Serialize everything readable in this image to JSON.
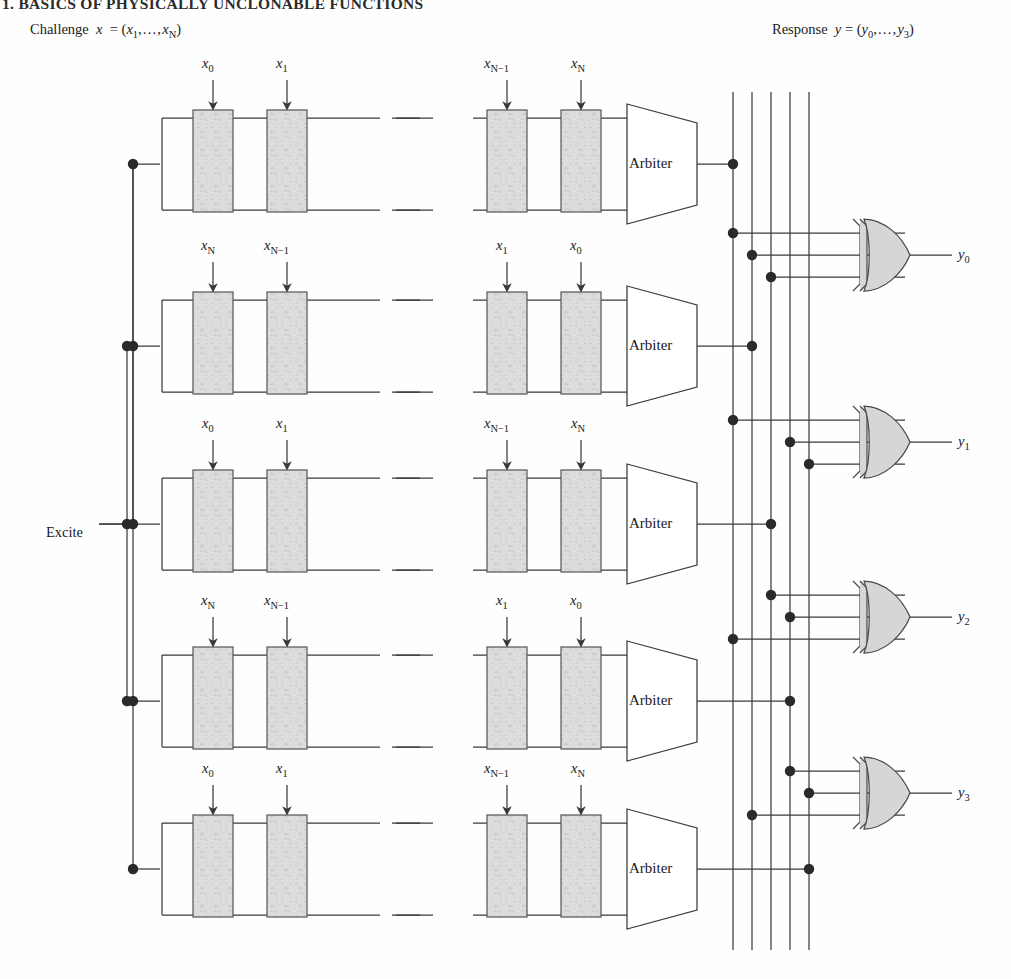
{
  "header": {
    "running_title": "1. BASICS OF PHYSICALLY UNCLONABLE FUNCTIONS"
  },
  "annotations": {
    "challenge": "Challenge x = (x₁,…,xₙ)",
    "challenge_plain": "Challenge",
    "response": "Response y = (y₀,…,y₃)",
    "response_plain": "Response",
    "excite": "Excite"
  },
  "diagram": {
    "type": "xor-arbiter-puf-schematic",
    "rows": 5,
    "stages_shown_per_row": 4,
    "arbiter_label": "Arbiter",
    "bus_lines": 5,
    "xor_gates": 4,
    "row_challenge_labels": [
      [
        "x0",
        "x1",
        "xN-1",
        "xN"
      ],
      [
        "xN",
        "xN-1",
        "x1",
        "x0"
      ],
      [
        "x0",
        "x1",
        "xN-1",
        "xN"
      ],
      [
        "xN",
        "xN-1",
        "x1",
        "x0"
      ],
      [
        "x0",
        "x1",
        "xN-1",
        "xN"
      ]
    ],
    "outputs": [
      "y0",
      "y1",
      "y2",
      "y3"
    ],
    "colors": {
      "line": "#3a3a3a",
      "stage_fill": "#d9d9d9",
      "stage_stroke": "#5a5a5a",
      "gate_fill": "#d6d6d6",
      "gate_stroke": "#4a4a4a",
      "arbiter_fill": "#ffffff",
      "dot": "#2a2a2a",
      "text": "#1a1a1a"
    }
  },
  "sub_labels": {
    "x0": "0",
    "x1": "1",
    "xN": "N",
    "xNm1": "N−1",
    "y0": "0",
    "y1": "1",
    "y2": "2",
    "y3": "3",
    "c1": "1",
    "cN": "N"
  }
}
